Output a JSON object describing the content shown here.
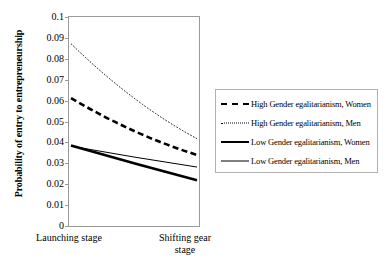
{
  "chart_data": {
    "type": "line",
    "title": "",
    "xlabel": "",
    "ylabel": "Probability of entry to entrepreneurship",
    "categories": [
      "Launching stage",
      "Shifting gear stage"
    ],
    "ylim": [
      0,
      0.1
    ],
    "yticks": [
      "0.1",
      "0.09",
      "0.08",
      "0.07",
      "0.06",
      "0.05",
      "0.04",
      "0.03",
      "0.02",
      "0.01",
      "0"
    ],
    "ytick_values": [
      0.1,
      0.09,
      0.08,
      0.07,
      0.06,
      0.05,
      0.04,
      0.03,
      0.02,
      0.01,
      0
    ],
    "grid": false,
    "legend_position": "right",
    "series": [
      {
        "name": "High Gender egalitarianism, Women",
        "style": "thick-dashed",
        "values": [
          0.0612,
          0.034
        ],
        "curve_mid": 0.0455
      },
      {
        "name": "High Gender egalitarianism, Men",
        "style": "thin-dotted",
        "values": [
          0.0872,
          0.0418
        ],
        "curve_mid": 0.0612
      },
      {
        "name": "Low Gender egalitarianism, Women",
        "style": "thick-solid",
        "values": [
          0.0385,
          0.0219
        ],
        "curve_mid": 0.03
      },
      {
        "name": "Low Gender egalitarianism, Men",
        "style": "thin-solid",
        "values": [
          0.0382,
          0.0282
        ],
        "curve_mid": 0.033
      }
    ]
  },
  "axis": {
    "y_title": "Probability of entry to entrepreneurship",
    "x_label_left": "Launching stage",
    "x_label_right_line1": "Shifting gear",
    "x_label_right_line2": "stage"
  },
  "legend": {
    "items": [
      {
        "label": "High Gender egalitarianism, Women",
        "key": "thick-dashed"
      },
      {
        "label": "High Gender egalitarianism, Men",
        "key": "thin-dotted"
      },
      {
        "label": "Low Gender egalitarianism, Women",
        "key": "thick-solid"
      },
      {
        "label": "Low Gender egalitarianism, Men",
        "key": "thin-solid"
      }
    ]
  },
  "colors": {
    "line": "#000000",
    "frame": "#9a9a9a",
    "legend_border": "#b0b0b0",
    "background": "#ffffff"
  }
}
